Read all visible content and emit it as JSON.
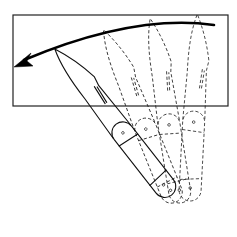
{
  "figure": {
    "motion_direction": "counter-clockwise",
    "positions": [
      {
        "name": "open-position",
        "style": "solid",
        "angle_deg": -38
      },
      {
        "name": "intermediate-position-1",
        "style": "dashed",
        "angle_deg": -22
      },
      {
        "name": "intermediate-position-2",
        "style": "dashed",
        "angle_deg": -10
      },
      {
        "name": "closed-position",
        "style": "dashed",
        "angle_deg": 4
      }
    ],
    "colors": {
      "line": "#111111",
      "background": "#ffffff"
    }
  }
}
